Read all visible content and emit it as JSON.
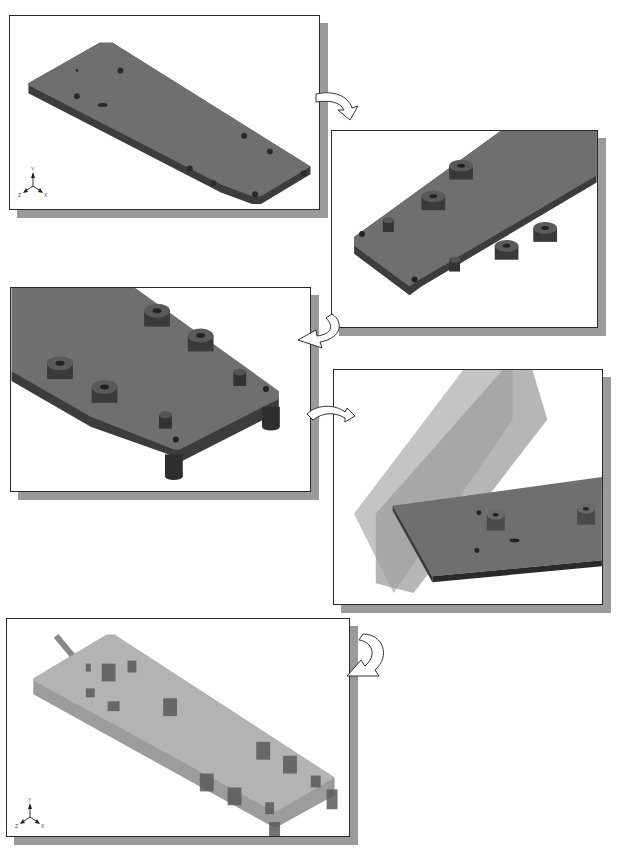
{
  "figure": {
    "colors": {
      "solid_shade": "#6e6e6e",
      "solid_top": "#7a7a7a",
      "solid_side": "#3c3c3c",
      "transparent_part": "#b0b0b0",
      "plane_fill": "#9a9a9a",
      "frame_border": "#2a2a2a",
      "frame_shadow": "#9a9a9a",
      "arrow_fill": "#ffffff",
      "arrow_stroke": "#333333"
    },
    "panels": [
      {
        "id": "step-1",
        "label": "Base plate with holes (isometric view)"
      },
      {
        "id": "step-2",
        "label": "Bosses added on plate end"
      },
      {
        "id": "step-3",
        "label": "Close-up with bosses and standoff legs"
      },
      {
        "id": "step-4",
        "label": "Datum planes through plate"
      },
      {
        "id": "step-5",
        "label": "Transparent view of completed plate"
      }
    ],
    "axis_triad": {
      "y_label": "Y",
      "x_label": "X",
      "z_label": "Z"
    },
    "arrows": [
      {
        "from": "step-1",
        "to": "step-2"
      },
      {
        "from": "step-2",
        "to": "step-3"
      },
      {
        "from": "step-3",
        "to": "step-4"
      },
      {
        "from": "step-4",
        "to": "step-5"
      }
    ]
  }
}
